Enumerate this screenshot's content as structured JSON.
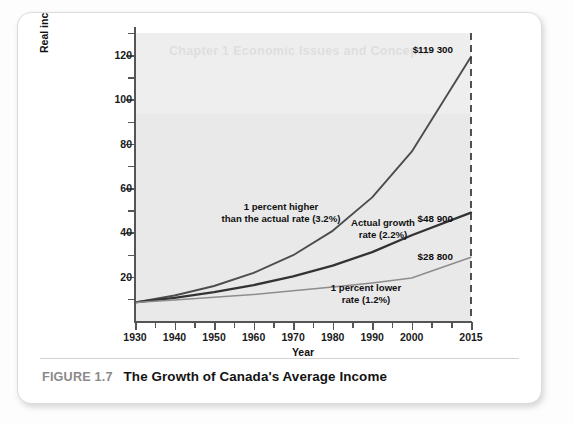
{
  "figure": {
    "number_label": "FIGURE 1.7",
    "title": "The Growth of Canada's Average Income",
    "ghost_artifact_text": "Chapter 1 Economic Issues and Concepts"
  },
  "chart_data": {
    "type": "line",
    "title": "The Growth of Canada's Average Income",
    "xlabel": "Year",
    "ylabel": "Real income per capita ($thousands)",
    "xlim": [
      1930,
      2015
    ],
    "ylim": [
      0,
      130
    ],
    "xticks_major": [
      1930,
      1940,
      1950,
      1960,
      1970,
      1980,
      1990,
      2000,
      2015
    ],
    "xticks_minor": [
      1935,
      1945,
      1955,
      1965,
      1975,
      1985,
      1995,
      2005,
      2010
    ],
    "yticks_major": [
      20,
      40,
      60,
      80,
      100,
      120
    ],
    "yticks_minor": [
      10,
      30,
      50,
      70,
      90,
      110,
      130
    ],
    "grid": false,
    "legend_position": "inline-annotations",
    "reference_line": {
      "x": 2015,
      "style": "dashed",
      "color": "#333333"
    },
    "series": [
      {
        "name": "1 percent higher than the actual rate (3.2%)",
        "rate_percent": 3.2,
        "color": "#4d4d4d",
        "width": 1.9,
        "end_label": "$119 300",
        "x": [
          1930,
          1940,
          1950,
          1960,
          1970,
          1980,
          1990,
          2000,
          2015
        ],
        "values": [
          8.4,
          11.5,
          15.8,
          21.7,
          29.7,
          40.7,
          55.8,
          76.4,
          119.3
        ]
      },
      {
        "name": "Actual growth rate (2.2%)",
        "rate_percent": 2.2,
        "color": "#333333",
        "width": 2.3,
        "end_label": "$48 900",
        "x": [
          1930,
          1940,
          1950,
          1960,
          1970,
          1980,
          1990,
          2000,
          2015
        ],
        "values": [
          8.4,
          10.4,
          13.0,
          16.2,
          20.1,
          25.0,
          31.1,
          38.7,
          48.9
        ]
      },
      {
        "name": "1 percent lower rate (1.2%)",
        "rate_percent": 1.2,
        "color": "#8d8d8d",
        "width": 1.5,
        "end_label": "$28 800",
        "x": [
          1930,
          1940,
          1950,
          1960,
          1970,
          1980,
          1990,
          2000,
          2015
        ],
        "values": [
          8.4,
          9.5,
          10.7,
          12.0,
          13.6,
          15.3,
          17.2,
          19.4,
          28.8
        ]
      }
    ],
    "annotations": [
      {
        "id": "higher",
        "text": "1 percent higher\nthan the actual rate (3.2%)"
      },
      {
        "id": "actual",
        "text": "Actual growth\nrate (2.2%)"
      },
      {
        "id": "lower",
        "text": "1 percent lower\nrate (1.2%)"
      }
    ],
    "end_labels": [
      "$119 300",
      "$48 900",
      "$28 800"
    ]
  },
  "colors": {
    "plot_background": "#e9e9e9",
    "axis": "#555555",
    "card": "#ffffff",
    "caption_number": "#8a8a8a"
  },
  "axis_tick_labels": {
    "y": [
      "20",
      "40",
      "60",
      "80",
      "100",
      "120"
    ],
    "x": [
      "1930",
      "1940",
      "1950",
      "1960",
      "1970",
      "1980",
      "1990",
      "2000",
      "2015"
    ]
  }
}
